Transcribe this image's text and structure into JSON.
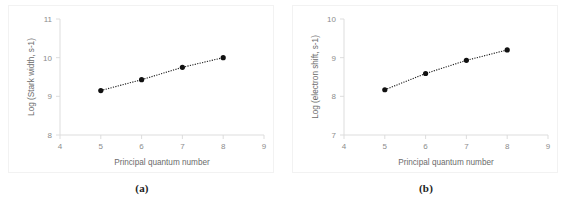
{
  "figure": {
    "panels": [
      {
        "caption": "(a)",
        "name": "panel-a",
        "chart_data": {
          "type": "line",
          "title": "",
          "xlabel": "Principal quantum number",
          "ylabel": "Log (Stark width, s-1)",
          "x": [
            5,
            6,
            7,
            8
          ],
          "values": [
            9.15,
            9.43,
            9.75,
            10.0
          ],
          "xlim": [
            4,
            9
          ],
          "ylim": [
            8,
            11
          ],
          "xticks": [
            4,
            5,
            6,
            7,
            8,
            9
          ],
          "yticks": [
            8,
            9,
            10,
            11
          ],
          "xtick_labels": [
            "4",
            "5",
            "6",
            "7",
            "8",
            "9"
          ],
          "ytick_labels": [
            "8",
            "9",
            "10",
            "11"
          ],
          "grid": false,
          "legend": "none",
          "line_style": "dotted",
          "marker": "filled-circle",
          "series_color": "#111111"
        }
      },
      {
        "caption": "(b)",
        "name": "panel-b",
        "chart_data": {
          "type": "line",
          "title": "",
          "xlabel": "Principal quantum number",
          "ylabel": "Log (electron shift, s-1)",
          "x": [
            5,
            6,
            7,
            8
          ],
          "values": [
            8.17,
            8.59,
            8.93,
            9.2
          ],
          "xlim": [
            4,
            9
          ],
          "ylim": [
            7,
            10
          ],
          "xticks": [
            4,
            5,
            6,
            7,
            8,
            9
          ],
          "yticks": [
            7,
            8,
            9,
            10
          ],
          "xtick_labels": [
            "4",
            "5",
            "6",
            "7",
            "8",
            "9"
          ],
          "ytick_labels": [
            "7",
            "8",
            "9",
            "10"
          ],
          "grid": false,
          "legend": "none",
          "line_style": "dotted",
          "marker": "filled-circle",
          "series_color": "#111111"
        }
      }
    ]
  }
}
